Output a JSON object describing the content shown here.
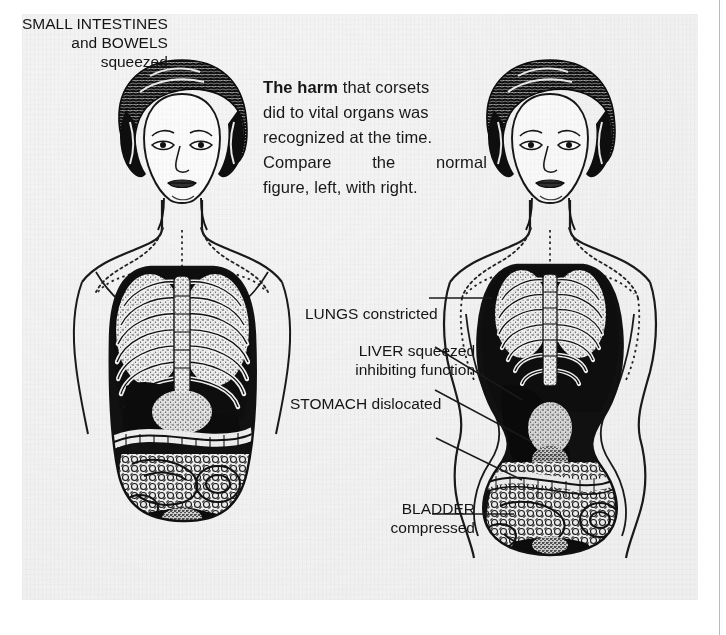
{
  "page": {
    "background_color": "#ffffff",
    "panel_color": "#f4f4f4",
    "ink_color": "#151515",
    "rule_color": "#b9b9b9"
  },
  "caption": {
    "line1_bold": "The harm",
    "line1_rest": "that corsets",
    "line2": "did to vital organs was",
    "line3": "recognized at the time.",
    "line4_words": [
      "Compare",
      "the",
      "normal"
    ],
    "line5": "figure, left, with right."
  },
  "annotations": [
    {
      "id": "lungs",
      "lines": [
        "LUNGS constricted"
      ]
    },
    {
      "id": "liver",
      "lines": [
        "LIVER squeezed",
        "inhibiting function"
      ]
    },
    {
      "id": "stomach",
      "lines": [
        "STOMACH dislocated"
      ]
    },
    {
      "id": "intestines",
      "lines": [
        "SMALL INTESTINES",
        "and BOWELS",
        "squeezed"
      ]
    },
    {
      "id": "bladder",
      "lines": [
        "BLADDER",
        "compressed"
      ]
    }
  ],
  "figures": {
    "left": {
      "title": "normal figure"
    },
    "right": {
      "title": "corseted figure"
    }
  }
}
